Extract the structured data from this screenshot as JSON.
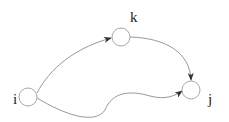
{
  "diagram": {
    "type": "directed-graph",
    "nodes": [
      {
        "id": "i",
        "label": "i",
        "cx": 28,
        "cy": 97,
        "r": 9,
        "label_x": 13,
        "label_y": 104
      },
      {
        "id": "k",
        "label": "k",
        "cx": 121,
        "cy": 37,
        "r": 9,
        "label_x": 130,
        "label_y": 22
      },
      {
        "id": "j",
        "label": "j",
        "cx": 191,
        "cy": 90,
        "r": 9,
        "label_x": 208,
        "label_y": 104
      }
    ],
    "edges": [
      {
        "from": "i",
        "to": "k"
      },
      {
        "from": "k",
        "to": "j"
      },
      {
        "from": "i",
        "to": "j"
      }
    ],
    "colors": {
      "node_stroke": "#a8a8a8",
      "edge_stroke": "#8c8c8c",
      "arrowhead": "#333333",
      "label": "#222222"
    }
  }
}
